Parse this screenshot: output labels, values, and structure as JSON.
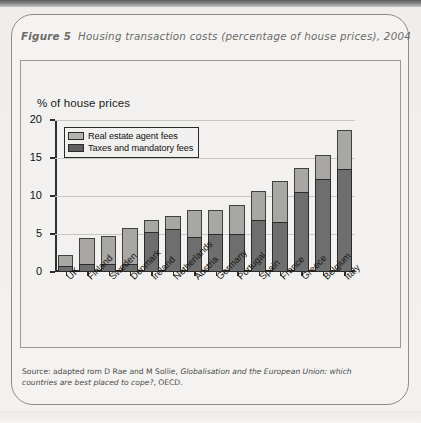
{
  "figure": {
    "number": "Figure 5",
    "caption": "Housing transaction costs (percentage of house prices), 2004",
    "source_prefix": "Source: adapted rom D Rae and M Sollie, ",
    "source_italic": "Globalisation and the European Union: which countries are best placed to cope?",
    "source_suffix": ", OECD."
  },
  "chart_data": {
    "type": "bar",
    "subtype": "stacked-vertical",
    "title": "Housing transaction costs (percentage of house prices), 2004",
    "ylabel": "% of house prices",
    "xlabel": "",
    "ylim": [
      0,
      20
    ],
    "yticks": [
      0,
      5,
      10,
      15,
      20
    ],
    "ytick_labels": [
      "0",
      "5",
      "10",
      "15",
      "20"
    ],
    "grid": true,
    "grid_axis": "y",
    "legend_position": "upper-left-inside",
    "categories": [
      "UK",
      "Finland",
      "Sweden",
      "Denmark",
      "Ireland",
      "Netherlands",
      "Austria",
      "Germany",
      "Portugal",
      "Spain",
      "France",
      "Greece",
      "Belgium",
      "Italy"
    ],
    "series": [
      {
        "name": "Taxes and mandatory fees",
        "color": "#6e6e6e",
        "values": [
          0.8,
          1.1,
          1.0,
          1.1,
          5.3,
          5.7,
          4.6,
          5.0,
          5.0,
          6.8,
          6.6,
          10.5,
          12.3,
          13.5
        ]
      },
      {
        "name": "Real estate agent fees",
        "color": "#a8a7a4",
        "values": [
          1.5,
          3.4,
          3.7,
          4.7,
          1.6,
          1.7,
          3.6,
          3.2,
          3.8,
          3.9,
          5.4,
          3.2,
          3.1,
          5.2
        ]
      }
    ],
    "totals": [
      2.3,
      4.5,
      4.7,
      5.8,
      6.9,
      7.4,
      8.2,
      8.2,
      8.8,
      10.7,
      12.0,
      13.7,
      15.4,
      18.7
    ]
  },
  "legend": {
    "items": [
      {
        "label": "Real estate agent fees",
        "swatch": "light-gray"
      },
      {
        "label": "Taxes and mandatory fees",
        "swatch": "dark-gray"
      }
    ]
  },
  "colors": {
    "agent_fees": "#a8a7a4",
    "taxes": "#6e6e6e",
    "page_background": "#f3f2f0",
    "frame": "#8e8d8a",
    "axis": "#2f2f2f",
    "gridline": "#c8c7c4"
  }
}
